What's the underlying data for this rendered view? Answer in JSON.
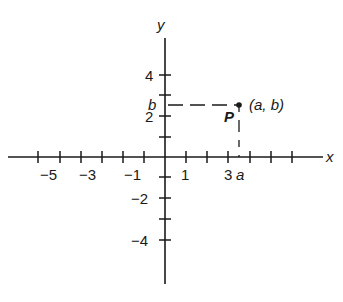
{
  "diagram": {
    "type": "cartesian-coordinate-plane",
    "colors": {
      "ink": "#1a1a1a",
      "background": "#ffffff"
    },
    "axes": {
      "x_label": "x",
      "y_label": "y",
      "x_tick_labels": [
        {
          "value": -5,
          "text": "−5"
        },
        {
          "value": -3,
          "text": "−3"
        },
        {
          "value": -1,
          "text": "−1"
        },
        {
          "value": 1,
          "text": "1"
        },
        {
          "value": 3,
          "text": "3"
        }
      ],
      "y_tick_labels": [
        {
          "value": 4,
          "text": "4"
        },
        {
          "value": 2,
          "text": "2"
        },
        {
          "value": -2,
          "text": "−2"
        },
        {
          "value": -4,
          "text": "−4"
        }
      ],
      "x_ticks": [
        -6,
        -5,
        -4,
        -3,
        -2,
        -1,
        1,
        2,
        3,
        4,
        5,
        6
      ],
      "y_ticks": [
        4,
        3,
        2,
        1,
        -1,
        -2,
        -3,
        -4
      ]
    },
    "point": {
      "name": "P",
      "coordinate_label": "(a, b)",
      "x_projection_label": "a",
      "y_projection_label": "b",
      "approx_x": 3.5,
      "approx_y": 2.5
    }
  }
}
